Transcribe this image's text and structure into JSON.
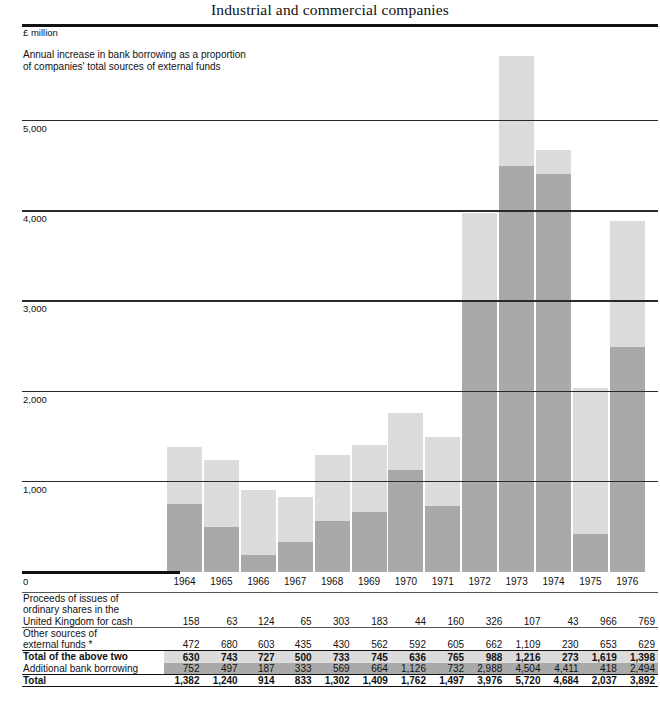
{
  "title": "Industrial and commercial companies",
  "chart": {
    "unit_label": "£ million",
    "caption": "Annual increase in bank borrowing as a proportion\nof companies' total sources of external funds",
    "zero_label": "0",
    "colors": {
      "light": "#dcdcdc",
      "dark": "#a9a9a9",
      "axis": "#111111"
    }
  },
  "chart_data": {
    "type": "bar",
    "stacked": true,
    "title": "Industrial and commercial companies",
    "subtitle": "Annual increase in bank borrowing as a proportion of companies' total sources of external funds",
    "xlabel": "",
    "ylabel": "£ million",
    "ylim": [
      0,
      5800
    ],
    "yticks": [
      0,
      1000,
      2000,
      3000,
      4000,
      5000
    ],
    "ytick_labels": [
      "0",
      "1,000",
      "2,000",
      "3,000",
      "4,000",
      "5,000"
    ],
    "grid": true,
    "legend_position": "none",
    "categories": [
      "1964",
      "1965",
      "1966",
      "1967",
      "1968",
      "1969",
      "1970",
      "1971",
      "1972",
      "1973",
      "1974",
      "1975",
      "1976"
    ],
    "series": [
      {
        "name": "Additional bank borrowing",
        "color": "#a9a9a9",
        "values": [
          752,
          497,
          187,
          333,
          569,
          664,
          1126,
          732,
          2988,
          4504,
          4411,
          418,
          2494
        ]
      },
      {
        "name": "Total of the above two",
        "color": "#dcdcdc",
        "values": [
          630,
          743,
          727,
          500,
          733,
          745,
          636,
          765,
          988,
          1216,
          273,
          1619,
          1398
        ]
      }
    ],
    "totals": [
      1382,
      1240,
      914,
      833,
      1302,
      1409,
      1762,
      1497,
      3976,
      5720,
      4684,
      2037,
      3892
    ]
  },
  "table": {
    "years": [
      "1964",
      "1965",
      "1966",
      "1967",
      "1968",
      "1969",
      "1970",
      "1971",
      "1972",
      "1973",
      "1974",
      "1975",
      "1976"
    ],
    "rows": [
      {
        "label": "Proceeds of issues of\nordinary shares in the\nUnited Kingdom for cash",
        "values": [
          "158",
          "63",
          "124",
          "65",
          "303",
          "183",
          "44",
          "160",
          "326",
          "107",
          "43",
          "966",
          "769"
        ]
      },
      {
        "label": "Other sources of\nexternal funds *",
        "values": [
          "472",
          "680",
          "603",
          "435",
          "430",
          "562",
          "592",
          "605",
          "662",
          "1,109",
          "230",
          "653",
          "629"
        ]
      },
      {
        "label": "Total of the above two",
        "values": [
          "630",
          "743",
          "727",
          "500",
          "733",
          "745",
          "636",
          "765",
          "988",
          "1,216",
          "273",
          "1,619",
          "1,398"
        ]
      },
      {
        "label": "Additional bank borrowing",
        "values": [
          "752",
          "497",
          "187",
          "333",
          "569",
          "664",
          "1,126",
          "732",
          "2,988",
          "4,504",
          "4,411",
          "418",
          "2,494"
        ]
      },
      {
        "label": "Total",
        "values": [
          "1,382",
          "1,240",
          "914",
          "833",
          "1,302",
          "1,409",
          "1,762",
          "1,497",
          "3,976",
          "5,720",
          "4,684",
          "2,037",
          "3,892"
        ]
      }
    ]
  }
}
